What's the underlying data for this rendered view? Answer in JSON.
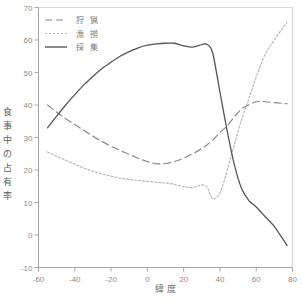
{
  "chart_data": {
    "type": "line",
    "title": "",
    "xlabel": "緯  度",
    "ylabel": "食事中の占有率",
    "ylabel_chars": [
      "食",
      "事",
      "中",
      "の",
      "占",
      "有",
      "率"
    ],
    "xlim": [
      -60,
      80
    ],
    "ylim": [
      -10,
      70
    ],
    "xticks": [
      -60,
      -40,
      -20,
      0,
      20,
      40,
      60,
      80
    ],
    "yticks": [
      -10,
      0,
      10,
      20,
      30,
      40,
      50,
      60,
      70
    ],
    "grid": false,
    "legend_position": "top-left",
    "x": [
      -55,
      -50,
      -45,
      -40,
      -35,
      -30,
      -25,
      -20,
      -15,
      -10,
      -5,
      0,
      5,
      10,
      15,
      20,
      25,
      30,
      33,
      36,
      40,
      44,
      48,
      52,
      56,
      60,
      65,
      70,
      77
    ],
    "series": [
      {
        "name": "狩  猟",
        "label": "狩  猟",
        "style": "dashed",
        "color": "#8a8a8a",
        "values": [
          40.0,
          37.8,
          35.8,
          34.0,
          32.2,
          30.4,
          28.8,
          27.3,
          26.0,
          24.8,
          23.6,
          22.6,
          21.9,
          22.0,
          22.6,
          23.6,
          25.0,
          26.6,
          27.8,
          29.2,
          31.5,
          33.6,
          36.4,
          38.8,
          40.1,
          41.0,
          41.0,
          40.7,
          40.4
        ]
      },
      {
        "name": "漁  撈",
        "label": "漁  撈",
        "style": "dotted",
        "color": "#b8b8b8",
        "values": [
          25.5,
          24.2,
          23.0,
          21.8,
          20.6,
          19.6,
          18.8,
          18.1,
          17.5,
          17.1,
          16.8,
          16.5,
          16.2,
          16.0,
          15.6,
          14.9,
          14.6,
          15.4,
          14.6,
          11.2,
          13.0,
          20.0,
          28.0,
          35.6,
          42.0,
          48.6,
          55.6,
          60.0,
          65.5
        ]
      },
      {
        "name": "採  集",
        "label": "採  集",
        "style": "solid",
        "color": "#555555",
        "values": [
          33.0,
          36.6,
          40.0,
          43.2,
          46.2,
          48.8,
          51.2,
          53.2,
          55.0,
          56.4,
          57.6,
          58.4,
          58.8,
          59.0,
          59.0,
          58.2,
          57.8,
          58.6,
          58.6,
          56.0,
          44.0,
          32.0,
          21.5,
          14.2,
          10.6,
          8.6,
          5.6,
          2.6,
          -3.2
        ]
      }
    ]
  },
  "legend": {
    "items": [
      {
        "label": "狩  猟",
        "style": "dashed",
        "color": "#8a8a8a"
      },
      {
        "label": "漁  撈",
        "style": "dotted",
        "color": "#b8b8b8"
      },
      {
        "label": "採  集",
        "style": "solid",
        "color": "#555555"
      }
    ]
  }
}
